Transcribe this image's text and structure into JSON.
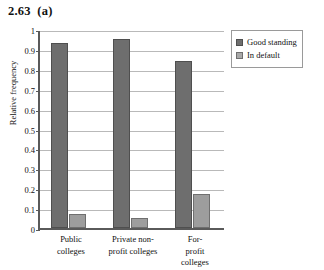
{
  "chart_data": {
    "type": "bar",
    "title": "2.63  (a)",
    "xlabel": "",
    "ylabel": "Relative frequency",
    "ylim": [
      0,
      1
    ],
    "ytick_step": 0.1,
    "grid": true,
    "legend_position": "right",
    "categories": [
      "Public colleges",
      "Private non-profit colleges",
      "For-profit colleges"
    ],
    "category_lines": [
      [
        "Public",
        "colleges"
      ],
      [
        "Private non-",
        "profit colleges"
      ],
      [
        "For-profit",
        "colleges"
      ]
    ],
    "yticks": [
      "1",
      "0.9",
      "0.8",
      "0.7",
      "0.6",
      "0.5",
      "0.4",
      "0.3",
      "0.2",
      "0.1",
      "0"
    ],
    "ytick_values": [
      1,
      0.9,
      0.8,
      0.7,
      0.6,
      0.5,
      0.4,
      0.3,
      0.2,
      0.1,
      0
    ],
    "series": [
      {
        "name": "Good standing",
        "color": "#6e6e6e",
        "values": [
          0.93,
          0.95,
          0.84
        ]
      },
      {
        "name": "In default",
        "color": "#9d9d9d",
        "values": [
          0.07,
          0.05,
          0.17
        ]
      }
    ]
  },
  "legend": {
    "items": [
      {
        "label": "Good standing",
        "swatch": "good"
      },
      {
        "label": "In default",
        "swatch": "default"
      }
    ]
  }
}
